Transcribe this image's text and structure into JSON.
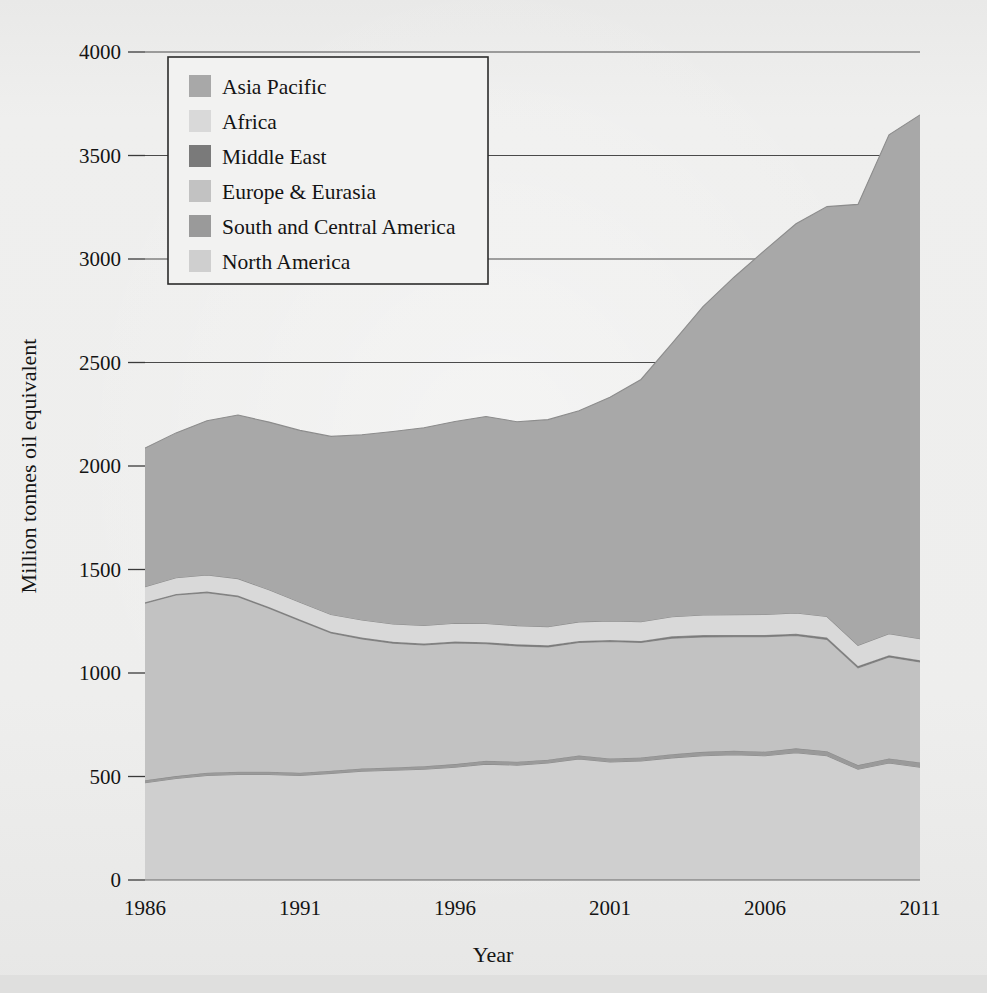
{
  "figure": {
    "background_color": "#ececeb",
    "ink_color": "#141414"
  },
  "axes": {
    "x_title": "Year",
    "y_title": "Million tonnes oil equivalent",
    "x_tick_labels": [
      "1986",
      "1991",
      "1996",
      "2001",
      "2006",
      "2011"
    ],
    "y_tick_labels": [
      "0",
      "500",
      "1000",
      "1500",
      "2000",
      "2500",
      "3000",
      "3500",
      "4000"
    ]
  },
  "legend": {
    "items": [
      {
        "label": "Asia Pacific",
        "color": "#a8a8a8"
      },
      {
        "label": "Africa",
        "color": "#d9d9d9"
      },
      {
        "label": "Middle East",
        "color": "#7a7a7a"
      },
      {
        "label": "Europe & Eurasia",
        "color": "#c2c2c2"
      },
      {
        "label": "South and Central America",
        "color": "#9a9a9a"
      },
      {
        "label": "North America",
        "color": "#cfcfcf"
      }
    ]
  },
  "chart_data": {
    "type": "area",
    "stacked": true,
    "title": "",
    "xlabel": "Year",
    "ylabel": "Million tonnes oil equivalent",
    "xlim": [
      1986,
      2011
    ],
    "ylim": [
      0,
      4000
    ],
    "ytick_values": [
      0,
      500,
      1000,
      1500,
      2000,
      2500,
      3000,
      3500,
      4000
    ],
    "xtick_values": [
      1986,
      1991,
      1996,
      2001,
      2006,
      2011
    ],
    "grid": "horizontal",
    "legend_position": "upper-left-inside",
    "x": [
      1986,
      1987,
      1988,
      1989,
      1990,
      1991,
      1992,
      1993,
      1994,
      1995,
      1996,
      1997,
      1998,
      1999,
      2000,
      2001,
      2002,
      2003,
      2004,
      2005,
      2006,
      2007,
      2008,
      2009,
      2010,
      2011
    ],
    "series": [
      {
        "name": "North America",
        "color": "#cfcfcf",
        "values": [
          470,
          490,
          505,
          510,
          510,
          505,
          515,
          525,
          530,
          535,
          545,
          560,
          555,
          565,
          585,
          570,
          575,
          590,
          600,
          605,
          600,
          615,
          600,
          535,
          565,
          545
        ]
      },
      {
        "name": "South and Central America",
        "color": "#9a9a9a",
        "values": [
          12,
          12,
          13,
          13,
          13,
          13,
          13,
          14,
          14,
          15,
          15,
          16,
          16,
          16,
          17,
          17,
          17,
          18,
          19,
          20,
          20,
          21,
          22,
          20,
          22,
          23
        ]
      },
      {
        "name": "Europe & Eurasia",
        "color": "#c2c2c2",
        "values": [
          855,
          875,
          870,
          845,
          790,
          735,
          665,
          625,
          600,
          585,
          585,
          565,
          560,
          545,
          545,
          565,
          555,
          560,
          555,
          550,
          555,
          545,
          540,
          470,
          490,
          485
        ]
      },
      {
        "name": "Middle East",
        "color": "#7a7a7a",
        "values": [
          5,
          5,
          6,
          6,
          6,
          6,
          6,
          7,
          7,
          7,
          7,
          8,
          8,
          8,
          8,
          8,
          8,
          9,
          9,
          9,
          9,
          9,
          9,
          9,
          9,
          9
        ]
      },
      {
        "name": "Africa",
        "color": "#d9d9d9",
        "values": [
          75,
          78,
          80,
          82,
          83,
          83,
          84,
          85,
          86,
          88,
          88,
          90,
          90,
          90,
          92,
          92,
          93,
          95,
          97,
          98,
          99,
          100,
          102,
          100,
          104,
          104
        ]
      },
      {
        "name": "Asia Pacific",
        "color": "#a8a8a8",
        "values": [
          670,
          700,
          745,
          790,
          810,
          830,
          860,
          895,
          930,
          955,
          975,
          1000,
          985,
          1000,
          1020,
          1080,
          1170,
          1320,
          1490,
          1630,
          1760,
          1880,
          1980,
          2130,
          2410,
          2530
        ]
      }
    ],
    "totals": [
      2087,
      2160,
      2219,
      2246,
      2212,
      2172,
      2143,
      2171,
      2167,
      2185,
      2215,
      2239,
      2214,
      2224,
      2267,
      2332,
      2418,
      2592,
      2770,
      2912,
      3043,
      3170,
      3253,
      3264,
      3600,
      3696
    ],
    "annotations": []
  }
}
